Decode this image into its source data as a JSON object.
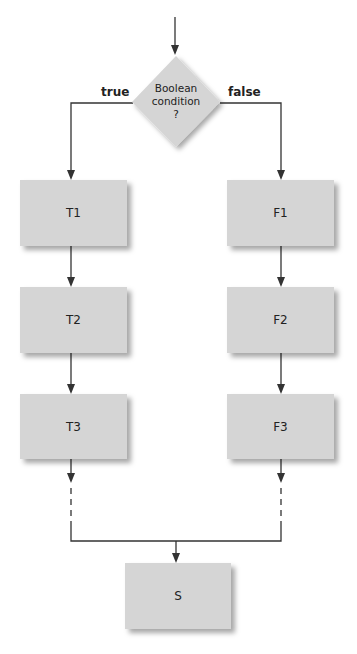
{
  "decision": {
    "label_lines": [
      "Boolean",
      "condition",
      "?"
    ],
    "true_label": "true",
    "false_label": "false"
  },
  "true_branch": [
    {
      "label": "T1"
    },
    {
      "label": "T2"
    },
    {
      "label": "T3"
    }
  ],
  "false_branch": [
    {
      "label": "F1"
    },
    {
      "label": "F2"
    },
    {
      "label": "F3"
    }
  ],
  "merge": {
    "label": "S"
  },
  "colors": {
    "box_fill": "#d5d5d5",
    "line": "#333333",
    "background": "#ffffff"
  }
}
